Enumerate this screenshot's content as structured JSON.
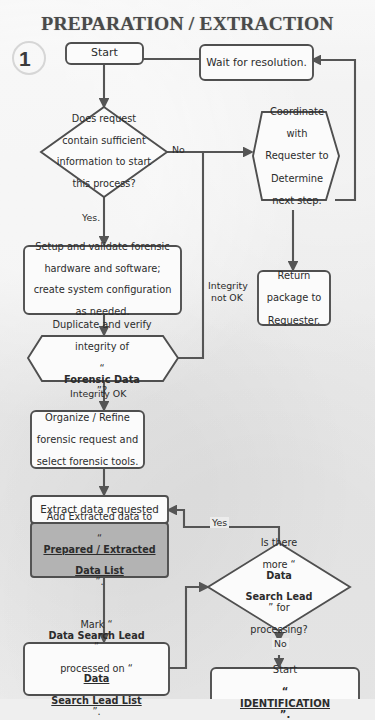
{
  "page": {
    "title": "PREPARATION / EXTRACTION",
    "step_number": "1",
    "background_color": "#ececec",
    "line_color": "#555555",
    "shaded_node_color": "#b3b3b3"
  },
  "nodes": {
    "start": {
      "label": "Start",
      "shape": "rounded-rect"
    },
    "wait": {
      "label": "Wait for resolution.",
      "shape": "rounded-rect"
    },
    "decision_request": {
      "line1": "Does request",
      "line2": "contain sufficient",
      "line3": "information to start",
      "line4": "this process?",
      "shape": "diamond"
    },
    "coordinate": {
      "line1": "Coordinate",
      "line2": "with",
      "line3": "Requester to",
      "line4": "Determine",
      "line5": "next step.",
      "shape": "hexagon"
    },
    "setup": {
      "line1": "Setup and validate forensic",
      "line2": "hardware and software;",
      "line3": "create system configuration",
      "line4": "as needed.",
      "shape": "rounded-rect"
    },
    "return_package": {
      "line1": "Return",
      "line2": "package to",
      "line3": "Requester.",
      "shape": "rounded-rect"
    },
    "duplicate": {
      "line1": "Duplicate and verify",
      "line2": "integrity of",
      "line3_quote_open": "“",
      "line3_bold": "Forensic Data",
      "line3_quote_close": "”?",
      "shape": "hexagon"
    },
    "organize": {
      "line1": "Organize / Refine",
      "line2": "forensic request and",
      "line3": "select forensic tools.",
      "shape": "rounded-rect"
    },
    "extract": {
      "label": "Extract data requested",
      "shape": "rounded-rect"
    },
    "add_extracted": {
      "line1": "Add Extracted data to",
      "line2_quote_open": "“",
      "line2_bold_underline": "Prepared / Extracted",
      "line3_bold_underline": "Data List",
      "line3_quote_close": "”.",
      "shape": "rect-shaded",
      "shaded": true
    },
    "decision_more": {
      "line1": "Is there",
      "line2_plain": "more “",
      "line2_bold": "Data",
      "line3_bold": "Search Lead",
      "line3_plain": "” for",
      "line4": "processing?",
      "shape": "diamond"
    },
    "mark": {
      "line1_plain": "Mark “",
      "line1_bold": "Data Search Lead",
      "line1_close": "”",
      "line2_plain": "processed on “",
      "line2_bold_underline": "Data",
      "line3_bold_underline": "Search Lead List",
      "line3_close": "”.",
      "shape": "rounded-rect"
    },
    "start_identification": {
      "line1": "Start",
      "line2_quote_open": "“",
      "line2_bold_underline": "IDENTIFICATION",
      "line2_quote_close": "”.",
      "shape": "rounded-rect"
    }
  },
  "edge_labels": {
    "no_request": "No",
    "yes_request": "Yes.",
    "integrity_not_ok_1": "Integrity",
    "integrity_not_ok_2": "not OK",
    "integrity_ok": "Integrity OK",
    "yes_more": "Yes",
    "no_more": "No"
  }
}
